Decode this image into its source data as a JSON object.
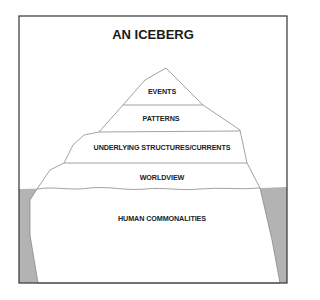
{
  "title": "AN ICEBERG",
  "layers": [
    {
      "label": "EVENTS"
    },
    {
      "label": "PATTERNS"
    },
    {
      "label": "UNDERLYING STRUCTURES/CURRENTS"
    },
    {
      "label": "WORLDVIEW"
    },
    {
      "label": "HUMAN COMMONALITIES"
    }
  ],
  "colors": {
    "frame": "#333333",
    "water": "#b3b3b3",
    "ice": "#ffffff",
    "outline": "#8a8a8a",
    "text": "#222222"
  }
}
